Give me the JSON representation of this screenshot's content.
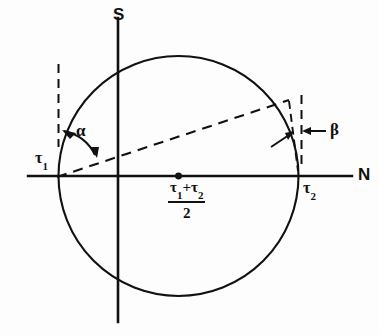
{
  "figure": {
    "background_color": "#fdfdfd",
    "ink_color": "#111111"
  },
  "axes": {
    "vertical_label": "S",
    "horizontal_label": "N",
    "origin_px": [
      118,
      176
    ],
    "horizontal_span_px": [
      28,
      352
    ],
    "vertical_span_px": [
      18,
      322
    ]
  },
  "circle": {
    "center_px": [
      178.5,
      176
    ],
    "radius_px": 120,
    "left_intercept_px": [
      58.5,
      176
    ],
    "right_intercept_px": [
      298.5,
      176
    ],
    "stroke_width": 2.1
  },
  "labels": {
    "tau1": "τ",
    "tau1_sub": "1",
    "tau2": "τ",
    "tau2_sub": "2",
    "alpha": "α",
    "beta": "β",
    "axis_s": "S",
    "axis_n": "N"
  },
  "center_fraction": {
    "numerator_tau1": "τ",
    "numerator_tau1_sub": "1",
    "numerator_plus": "+",
    "numerator_tau2": "τ",
    "numerator_tau2_sub": "2",
    "denominator": "2"
  },
  "dashed_elements": {
    "left_vertical_x_px": 58.5,
    "left_vertical_y_px": [
      64,
      147
    ],
    "right_vertical_x_px": 301.5,
    "right_vertical_y_px": [
      95,
      165
    ],
    "chord_start_px": [
      58.5,
      176
    ],
    "chord_end_px": [
      288,
      100
    ],
    "dash_pattern": "9,6"
  },
  "annotations": {
    "alpha_arc_note": "double-headed arc between circle at tau1 and the dashed chord",
    "beta_arrows_note": "inward pointing arrows marking gap at right side between chord and vertical"
  }
}
